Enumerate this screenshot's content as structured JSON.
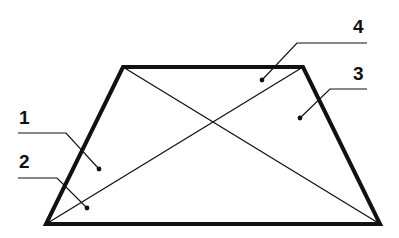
{
  "diagram": {
    "type": "trapezoid-with-diagonals",
    "colors": {
      "background": "#ffffff",
      "stroke": "#111111"
    },
    "trapezoid": {
      "vertices": {
        "top_left": [
          123,
          67
        ],
        "top_right": [
          303,
          67
        ],
        "bottom_right": [
          380,
          224
        ],
        "bottom_left": [
          46,
          224
        ]
      },
      "stroke_width": 4
    },
    "diagonals": [
      {
        "from": [
          123,
          67
        ],
        "to": [
          380,
          224
        ]
      },
      {
        "from": [
          303,
          67
        ],
        "to": [
          46,
          224
        ]
      }
    ],
    "callouts": [
      {
        "label": "1",
        "text_pos": [
          19,
          124
        ],
        "line": [
          [
            18,
            133
          ],
          [
            66,
            133
          ],
          [
            99,
            169
          ]
        ],
        "dot": [
          99,
          169
        ]
      },
      {
        "label": "2",
        "text_pos": [
          19,
          168
        ],
        "line": [
          [
            18,
            178
          ],
          [
            57,
            178
          ],
          [
            87,
            208
          ]
        ],
        "dot": [
          87,
          208
        ]
      },
      {
        "label": "3",
        "text_pos": [
          353,
          80
        ],
        "line": [
          [
            367,
            89
          ],
          [
            330,
            89
          ],
          [
            300,
            118
          ]
        ],
        "dot": [
          300,
          118
        ]
      },
      {
        "label": "4",
        "text_pos": [
          353,
          33
        ],
        "line": [
          [
            367,
            43
          ],
          [
            297,
            43
          ],
          [
            262,
            80
          ]
        ],
        "dot": [
          262,
          80
        ]
      }
    ]
  }
}
